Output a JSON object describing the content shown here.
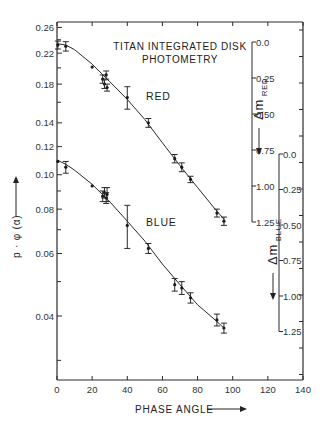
{
  "chart_data": {
    "type": "scatter",
    "title": "TITAN INTEGRATED DISK PHOTOMETRY",
    "xlabel": "PHASE ANGLE",
    "ylabel": "p · φ (α)",
    "xlim": [
      0,
      140
    ],
    "ylim": [
      0.026,
      0.268
    ],
    "yscale": "log",
    "x_ticks": [
      0,
      20,
      40,
      60,
      80,
      100,
      120,
      140
    ],
    "y_ticks": [
      0.04,
      0.06,
      0.08,
      0.1,
      0.12,
      0.14,
      0.18,
      0.22,
      0.26
    ],
    "y_tick_labels": [
      "0.04",
      "0.06",
      "0.08",
      "0.10",
      "0.12",
      "0.14",
      "0.18",
      "0.22",
      "0.26"
    ],
    "grid": false,
    "legend": "inline labels",
    "series": [
      {
        "name": "RED",
        "points": [
          {
            "x": 0.5,
            "y": 0.232,
            "err": 0.006
          },
          {
            "x": 5,
            "y": 0.23,
            "err": 0.007
          },
          {
            "x": 20,
            "y": 0.201,
            "err": 0.0
          },
          {
            "x": 26,
            "y": 0.186,
            "err": 0.005
          },
          {
            "x": 27,
            "y": 0.18,
            "err": 0.005
          },
          {
            "x": 28,
            "y": 0.191,
            "err": 0.005
          },
          {
            "x": 28.5,
            "y": 0.176,
            "err": 0.004
          },
          {
            "x": 40,
            "y": 0.165,
            "err": 0.012
          },
          {
            "x": 52,
            "y": 0.14,
            "err": 0.004
          },
          {
            "x": 67,
            "y": 0.111,
            "err": 0.003
          },
          {
            "x": 71,
            "y": 0.105,
            "err": 0.003
          },
          {
            "x": 76,
            "y": 0.097,
            "err": 0.002
          },
          {
            "x": 91,
            "y": 0.078,
            "err": 0.002
          },
          {
            "x": 95,
            "y": 0.074,
            "err": 0.002
          }
        ],
        "fit_curve": [
          [
            0,
            0.234
          ],
          [
            5,
            0.232
          ],
          [
            10,
            0.225
          ],
          [
            20,
            0.205
          ],
          [
            30,
            0.183
          ],
          [
            40,
            0.163
          ],
          [
            50,
            0.143
          ],
          [
            60,
            0.123
          ],
          [
            70,
            0.106
          ],
          [
            80,
            0.092
          ],
          [
            90,
            0.08
          ],
          [
            95,
            0.075
          ]
        ]
      },
      {
        "name": "BLUE",
        "points": [
          {
            "x": 0.5,
            "y": 0.109,
            "err": 0.0
          },
          {
            "x": 5,
            "y": 0.105,
            "err": 0.004
          },
          {
            "x": 20,
            "y": 0.093,
            "err": 0.0
          },
          {
            "x": 26,
            "y": 0.087,
            "err": 0.003
          },
          {
            "x": 27,
            "y": 0.089,
            "err": 0.003
          },
          {
            "x": 28,
            "y": 0.086,
            "err": 0.003
          },
          {
            "x": 28.5,
            "y": 0.088,
            "err": 0.004
          },
          {
            "x": 40,
            "y": 0.072,
            "err": 0.01
          },
          {
            "x": 52,
            "y": 0.062,
            "err": 0.002
          },
          {
            "x": 67,
            "y": 0.049,
            "err": 0.002
          },
          {
            "x": 71,
            "y": 0.048,
            "err": 0.002
          },
          {
            "x": 76,
            "y": 0.045,
            "err": 0.0015
          },
          {
            "x": 91,
            "y": 0.039,
            "err": 0.0015
          },
          {
            "x": 95,
            "y": 0.037,
            "err": 0.0012
          }
        ],
        "fit_curve": [
          [
            0,
            0.11
          ],
          [
            5,
            0.107
          ],
          [
            10,
            0.103
          ],
          [
            20,
            0.094
          ],
          [
            30,
            0.084
          ],
          [
            40,
            0.074
          ],
          [
            50,
            0.065
          ],
          [
            60,
            0.056
          ],
          [
            70,
            0.049
          ],
          [
            80,
            0.043
          ],
          [
            90,
            0.039
          ],
          [
            95,
            0.037
          ]
        ]
      }
    ],
    "secondary_axes": [
      {
        "name": "Δm RED",
        "label_main": "Δm",
        "label_sub": "RED",
        "ticks": [
          "0.0",
          "0.25",
          "0.50",
          "0.75",
          "1.00",
          "1.25"
        ],
        "direction": "down"
      },
      {
        "name": "Δm BLUE",
        "label_main": "Δm",
        "label_sub": "BLUE",
        "ticks": [
          "0.0",
          "0.25",
          "0.50",
          "0.75",
          "1.00",
          "1.25"
        ],
        "direction": "down"
      }
    ],
    "annotations": [
      "RED",
      "BLUE"
    ]
  },
  "labels": {
    "title_line1": "TITAN INTEGRATED DISK",
    "title_line2": "PHOTOMETRY",
    "xlabel": "PHASE ANGLE",
    "ylabel": "p · φ (α)",
    "red": "RED",
    "blue": "BLUE",
    "dm": "Δm",
    "dm_red_sub": "RED",
    "dm_blue_sub": "BLUE"
  }
}
